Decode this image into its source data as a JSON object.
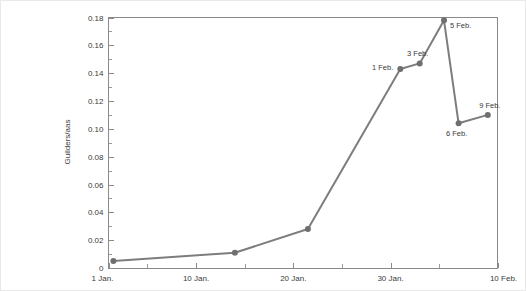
{
  "chart_data": {
    "type": "line",
    "title": "",
    "xlabel": "",
    "ylabel": "Guilders/aas",
    "ylim": [
      0,
      0.18
    ],
    "xlim_labels": [
      "1 Jan.",
      "10 Feb."
    ],
    "grid": false,
    "legend": "none",
    "y_ticks": [
      "0",
      "0.02",
      "0.04",
      "0.06",
      "0.08",
      "0.10",
      "0.12",
      "0.14",
      "0.16",
      "0.18"
    ],
    "y_tick_values": [
      0,
      0.02,
      0.04,
      0.06,
      0.08,
      0.1,
      0.12,
      0.14,
      0.16,
      0.18
    ],
    "x_ticks": [
      "1 Jan.",
      "10 Jan.",
      "20 Jan.",
      "30 Jan.",
      "10 Feb."
    ],
    "x_tick_values": [
      0,
      9,
      19,
      29,
      40
    ],
    "x_minor_tick_values": [
      4,
      14,
      24,
      34
    ],
    "x": [
      0.5,
      13,
      20.5,
      30,
      32,
      34.5,
      36,
      39
    ],
    "values": [
      0.005,
      0.011,
      0.028,
      0.143,
      0.147,
      0.178,
      0.104,
      0.11
    ],
    "point_labels": [
      "",
      "",
      "",
      "1 Feb.",
      "3 Feb.",
      "5 Feb.",
      "6 Feb.",
      "9 Feb."
    ],
    "annotations": [
      {
        "label": "1 Feb.",
        "x": 30,
        "y": 0.143
      },
      {
        "label": "3 Feb.",
        "x": 32,
        "y": 0.147
      },
      {
        "label": "5 Feb.",
        "x": 34.5,
        "y": 0.178
      },
      {
        "label": "6 Feb.",
        "x": 36,
        "y": 0.104
      },
      {
        "label": "9 Feb.",
        "x": 39,
        "y": 0.11
      }
    ],
    "colors": {
      "line": "#7d7d7d",
      "marker": "#6f6f6f",
      "axis": "#8a8a8a",
      "text": "#3b3b3b",
      "background": "#ffffff"
    }
  }
}
